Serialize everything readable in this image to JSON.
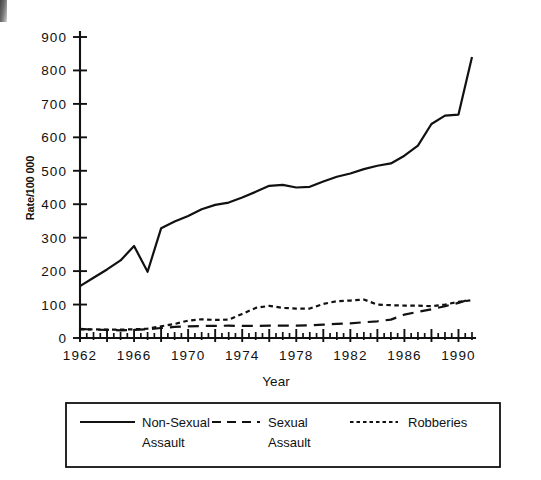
{
  "chart_data": {
    "type": "line",
    "title": "",
    "xlabel": "Year",
    "ylabel": "Rate/100 000",
    "xlim": [
      1962,
      1991
    ],
    "ylim": [
      0,
      900
    ],
    "ytick_step": 100,
    "xtick_step": 1,
    "xtick_label_step": 4,
    "grid": false,
    "legend_position": "bottom",
    "ytick_labels": [
      "0",
      "100",
      "200",
      "300",
      "400",
      "500",
      "600",
      "700",
      "800",
      "900"
    ],
    "ytick_values": [
      0,
      100,
      200,
      300,
      400,
      500,
      600,
      700,
      800,
      900
    ],
    "xtick_labels": [
      "1962",
      "1966",
      "1970",
      "1974",
      "1978",
      "1982",
      "1986",
      "1990"
    ],
    "xtick_label_values": [
      1962,
      1966,
      1970,
      1974,
      1978,
      1982,
      1986,
      1990
    ],
    "x": [
      1962,
      1963,
      1964,
      1965,
      1966,
      1967,
      1968,
      1969,
      1970,
      1971,
      1972,
      1973,
      1974,
      1975,
      1976,
      1977,
      1978,
      1979,
      1980,
      1981,
      1982,
      1983,
      1984,
      1985,
      1986,
      1987,
      1988,
      1989,
      1990,
      1991
    ],
    "series": [
      {
        "name": "Non-Sexual Assault",
        "style": "solid",
        "values": [
          155,
          180,
          205,
          232,
          275,
          198,
          328,
          348,
          365,
          385,
          398,
          405,
          420,
          437,
          455,
          458,
          450,
          452,
          468,
          482,
          492,
          505,
          515,
          522,
          545,
          575,
          640,
          665,
          668,
          840
        ]
      },
      {
        "name": "Sexual Assault",
        "style": "long-dash",
        "values": [
          27,
          25,
          24,
          23,
          24,
          26,
          30,
          33,
          35,
          36,
          36,
          37,
          36,
          36,
          37,
          37,
          37,
          38,
          40,
          42,
          44,
          47,
          50,
          55,
          70,
          78,
          86,
          95,
          105,
          118
        ]
      },
      {
        "name": "Robberies",
        "style": "short-dash",
        "values": [
          26,
          26,
          25,
          25,
          26,
          28,
          35,
          42,
          52,
          56,
          54,
          55,
          72,
          90,
          96,
          90,
          88,
          88,
          102,
          110,
          112,
          115,
          100,
          98,
          97,
          97,
          95,
          100,
          108,
          113
        ]
      }
    ]
  },
  "legend": {
    "entries": [
      {
        "label_line1": "Non-Sexual",
        "label_line2": "Assault",
        "style": "solid"
      },
      {
        "label_line1": "Sexual",
        "label_line2": "Assault",
        "style": "long-dash"
      },
      {
        "label_line1": "Robberies",
        "label_line2": "",
        "style": "short-dash"
      }
    ]
  },
  "axes": {
    "y_title": "Rate/100 000",
    "x_title": "Year"
  }
}
